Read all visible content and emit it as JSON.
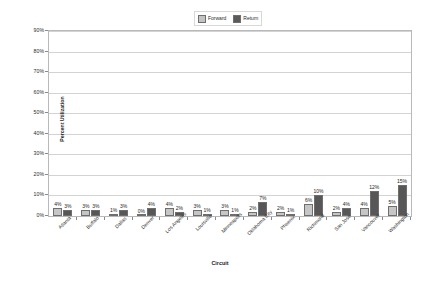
{
  "chart_data": {
    "type": "bar",
    "title": "",
    "xlabel": "Circuit",
    "ylabel": "Percent Utilization",
    "ylim": [
      0,
      90
    ],
    "ytick_step": 10,
    "ytick_labels": [
      "0%",
      "10%",
      "20%",
      "30%",
      "40%",
      "50%",
      "60%",
      "70%",
      "80%",
      "90%"
    ],
    "grid": true,
    "legend_position": "top-center",
    "categories": [
      "Atlanta",
      "Buffalo",
      "Dallas",
      "Denver",
      "Los Angeles",
      "Louisville",
      "Minneapolis",
      "Oklahoma City",
      "Phoenix",
      "Richmond",
      "San Jose",
      "Vancouver",
      "Washington"
    ],
    "series": [
      {
        "name": "Forward",
        "color": "#c6c6c6",
        "values": [
          4,
          3,
          1,
          0,
          4,
          3,
          3,
          2,
          2,
          6,
          2,
          4,
          5
        ],
        "labels": [
          "4%",
          "3%",
          "1%",
          "0%",
          "4%",
          "3%",
          "3%",
          "2%",
          "2%",
          "6%",
          "2%",
          "4%",
          "5%"
        ]
      },
      {
        "name": "Return",
        "color": "#575757",
        "values": [
          3,
          3,
          3,
          4,
          2,
          1,
          1,
          7,
          1,
          10,
          4,
          12,
          15
        ],
        "labels": [
          "3%",
          "3%",
          "3%",
          "4%",
          "2%",
          "1%",
          "1%",
          "7%",
          "1%",
          "10%",
          "4%",
          "12%",
          "15%"
        ]
      }
    ]
  },
  "legend": {
    "items": [
      {
        "label": "Forward"
      },
      {
        "label": "Return"
      }
    ]
  }
}
